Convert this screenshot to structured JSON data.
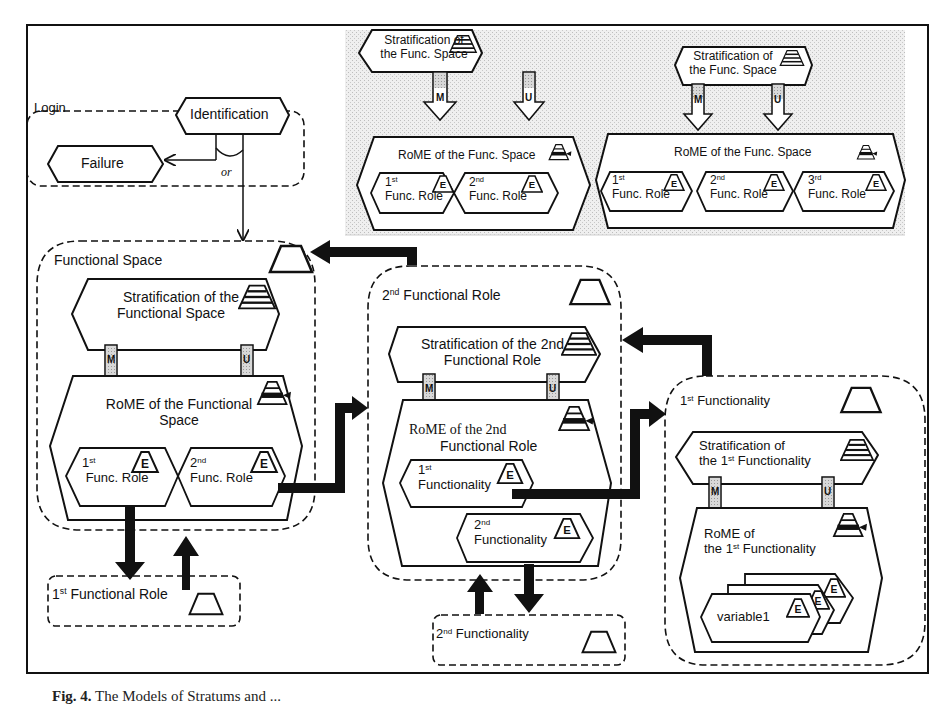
{
  "figure": {
    "caption_label": "Fig. 4.",
    "caption_text": "The Models of Stratums and ..."
  },
  "colors": {
    "line": "#111111",
    "background": "#ffffff",
    "shaded_region": "#e6e6e6",
    "arrow_fill_hollow": "#d9d9d9"
  },
  "legend_examples": {
    "example_a": {
      "stratification": {
        "line1": "Stratification of",
        "line2": "the Func. Space"
      },
      "arrow_m": "M",
      "arrow_u": "U",
      "rome": "RoME of the Func. Space",
      "roles": [
        {
          "ord": "1",
          "sup": "st",
          "label": "Func. Role",
          "badge": "E"
        },
        {
          "ord": "2",
          "sup": "nd",
          "label": "Func. Role",
          "badge": "E"
        }
      ]
    },
    "example_b": {
      "stratification": {
        "line1": "Stratification of",
        "line2": "the Func. Space"
      },
      "arrow_m": "M",
      "arrow_u": "U",
      "rome": "RoME of the Func. Space",
      "roles": [
        {
          "ord": "1",
          "sup": "st",
          "label": "Func. Role",
          "badge": "E"
        },
        {
          "ord": "2",
          "sup": "nd",
          "label": "Func. Role",
          "badge": "E"
        },
        {
          "ord": "3",
          "sup": "rd",
          "label": "Func. Role",
          "badge": "E"
        }
      ]
    }
  },
  "login": {
    "title": "Login",
    "identification": "Identification",
    "failure": "Failure",
    "or_label": "or"
  },
  "functional_space": {
    "title": "Functional Space",
    "stratification": {
      "line1": "Stratification of the",
      "line2": "Functional Space"
    },
    "arrow_m": "M",
    "arrow_u": "U",
    "rome": {
      "line1": "RoME of the Functional",
      "line2": "Space"
    },
    "roles": [
      {
        "ord": "1",
        "sup": "st",
        "label": "Func. Role",
        "badge": "E"
      },
      {
        "ord": "2",
        "sup": "nd",
        "label": "Func. Role",
        "badge": "E"
      }
    ]
  },
  "first_functional_role_box": {
    "ord": "1",
    "sup": "st",
    "label": "Functional Role"
  },
  "second_functional_role": {
    "ord": "2",
    "sup": "nd",
    "title": "Functional Role",
    "stratification": {
      "line1": "Stratification of the 2nd",
      "line2": "Functional Role"
    },
    "arrow_m": "M",
    "arrow_u": "U",
    "rome": {
      "line1": "RoME of the 2nd",
      "line2": "Functional Role"
    },
    "functionalities": [
      {
        "ord": "1",
        "sup": "st",
        "label": "Functionality",
        "badge": "E"
      },
      {
        "ord": "2",
        "sup": "nd",
        "label": "Functionality",
        "badge": "E"
      }
    ]
  },
  "second_functionality_box": {
    "ord": "2",
    "sup": "nd",
    "label": "Functionality"
  },
  "first_functionality": {
    "ord": "1",
    "sup": "st",
    "title": "Functionality",
    "stratification": {
      "line1": "Stratification of",
      "line2_pre": "the ",
      "line2_ord": "1",
      "line2_sup": "st",
      "line2_post": " Functionality"
    },
    "arrow_m": "M",
    "arrow_u": "U",
    "rome": {
      "line1": "RoME of",
      "line2_pre": "the ",
      "line2_ord": "1",
      "line2_sup": "st",
      "line2_post": " Functionality"
    },
    "variables": [
      {
        "label": "variable1",
        "badge": "E"
      },
      {
        "label": "",
        "badge": "E"
      },
      {
        "label": "",
        "badge": "E"
      }
    ]
  }
}
